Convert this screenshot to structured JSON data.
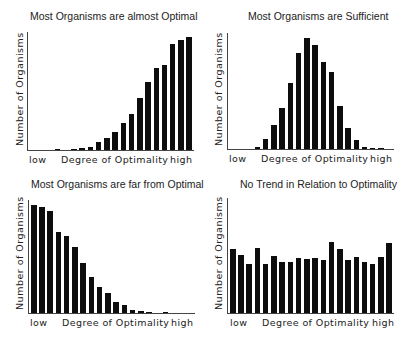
{
  "chart_data": [
    {
      "type": "bar",
      "title": "Most Organisms are almost Optimal",
      "xlabel": "Degree of Optimality",
      "ylabel": "Number of Organisms",
      "x_tick_labels": {
        "left": "low",
        "right": "high"
      },
      "categories": [
        "1",
        "2",
        "3",
        "4",
        "5",
        "6",
        "7",
        "8",
        "9",
        "10",
        "11",
        "12",
        "13",
        "14",
        "15",
        "16",
        "17",
        "18",
        "19",
        "20"
      ],
      "values": [
        0,
        0,
        0,
        1,
        0,
        1,
        2,
        3,
        7,
        11,
        16,
        24,
        32,
        46,
        60,
        72,
        75,
        94,
        97,
        100
      ],
      "ylim": [
        0,
        100
      ],
      "grid": false,
      "legend": null
    },
    {
      "type": "bar",
      "title": "Most Organisms are Sufficient",
      "xlabel": "Degree of Optimality",
      "ylabel": "Number of Organisms",
      "x_tick_labels": {
        "left": "low",
        "right": "high"
      },
      "categories": [
        "1",
        "2",
        "3",
        "4",
        "5",
        "6",
        "7",
        "8",
        "9",
        "10",
        "11",
        "12",
        "13",
        "14",
        "15",
        "16",
        "17",
        "18",
        "19",
        "20"
      ],
      "values": [
        0,
        0,
        0,
        2,
        9,
        22,
        37,
        59,
        86,
        100,
        93,
        78,
        69,
        39,
        19,
        8,
        2,
        1,
        1,
        0
      ],
      "ylim": [
        0,
        100
      ],
      "grid": false,
      "legend": null
    },
    {
      "type": "bar",
      "title": "Most Organisms are far from Optimal",
      "xlabel": "Degree of Optimality",
      "ylabel": "Number of Organisms",
      "x_tick_labels": {
        "left": "low",
        "right": "high"
      },
      "categories": [
        "1",
        "2",
        "3",
        "4",
        "5",
        "6",
        "7",
        "8",
        "9",
        "10",
        "11",
        "12",
        "13",
        "14",
        "15",
        "16",
        "17",
        "18",
        "19",
        "20"
      ],
      "values": [
        100,
        98,
        94,
        75,
        71,
        61,
        46,
        33,
        24,
        18,
        10,
        7,
        3,
        2,
        1,
        0,
        1,
        0,
        0,
        0
      ],
      "ylim": [
        0,
        100
      ],
      "grid": false,
      "legend": null
    },
    {
      "type": "bar",
      "title": "No Trend in Relation to Optimality",
      "xlabel": "Degree of Optimality",
      "ylabel": "Number of Organisms",
      "x_tick_labels": {
        "left": "low",
        "right": "high"
      },
      "categories": [
        "1",
        "2",
        "3",
        "4",
        "5",
        "6",
        "7",
        "8",
        "9",
        "10",
        "11",
        "12",
        "13",
        "14",
        "15",
        "16",
        "17",
        "18",
        "19",
        "20"
      ],
      "values": [
        58,
        53,
        44,
        59,
        44,
        52,
        46,
        46,
        50,
        49,
        50,
        48,
        64,
        58,
        48,
        51,
        46,
        44,
        51,
        63
      ],
      "ylim": [
        0,
        100
      ],
      "grid": false,
      "legend": null
    }
  ],
  "panels": [
    {
      "title": "Most Organisms are almost Optimal",
      "ylabel": "Number of Organisms",
      "xlabel": "Degree of Optimality",
      "low": "low",
      "high": "high"
    },
    {
      "title": "Most Organisms are Sufficient",
      "ylabel": "Number of Organisms",
      "xlabel": "Degree of Optimality",
      "low": "low",
      "high": "high"
    },
    {
      "title": "Most Organisms are far from Optimal",
      "ylabel": "Number of Organisms",
      "xlabel": "Degree of Optimality",
      "low": "low",
      "high": "high"
    },
    {
      "title": "No Trend in Relation to Optimality",
      "ylabel": "Number of Organisms",
      "xlabel": "Degree of Optimality",
      "low": "low",
      "high": "high"
    }
  ],
  "colors": {
    "bar": "#0d0d0d",
    "axis": "#444444",
    "background": "#ffffff"
  }
}
